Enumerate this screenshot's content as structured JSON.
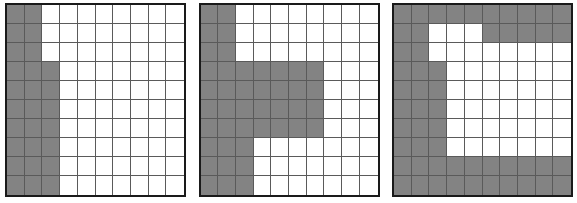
{
  "figure": {
    "title": "",
    "background_color": "#ffffff",
    "panel_count": 3,
    "grid_rows": 10,
    "grid_cols": 10,
    "shaded_color": "#838383",
    "empty_color": "#ffffff",
    "gridline_color": "#5a5a5a",
    "border_color": "#1a1a1a"
  },
  "chart_data": {
    "type": "heatmap",
    "title": "",
    "xlabel": "",
    "ylabel": "",
    "legend": [],
    "grid": true,
    "value_map": {
      "0": "empty-white-cell",
      "1": "shaded-gray-cell"
    },
    "panels": [
      {
        "name": "panel-1",
        "label": "",
        "rows": 10,
        "cols": 10,
        "matrix": [
          [
            1,
            1,
            0,
            0,
            0,
            0,
            0,
            0,
            0,
            0
          ],
          [
            1,
            1,
            0,
            0,
            0,
            0,
            0,
            0,
            0,
            0
          ],
          [
            1,
            1,
            0,
            0,
            0,
            0,
            0,
            0,
            0,
            0
          ],
          [
            1,
            1,
            1,
            0,
            0,
            0,
            0,
            0,
            0,
            0
          ],
          [
            1,
            1,
            1,
            0,
            0,
            0,
            0,
            0,
            0,
            0
          ],
          [
            1,
            1,
            1,
            0,
            0,
            0,
            0,
            0,
            0,
            0
          ],
          [
            1,
            1,
            1,
            0,
            0,
            0,
            0,
            0,
            0,
            0
          ],
          [
            1,
            1,
            1,
            0,
            0,
            0,
            0,
            0,
            0,
            0
          ],
          [
            1,
            1,
            1,
            0,
            0,
            0,
            0,
            0,
            0,
            0
          ],
          [
            1,
            1,
            1,
            0,
            0,
            0,
            0,
            0,
            0,
            0
          ]
        ]
      },
      {
        "name": "panel-2",
        "label": "",
        "rows": 10,
        "cols": 10,
        "matrix": [
          [
            1,
            1,
            0,
            0,
            0,
            0,
            0,
            0,
            0,
            0
          ],
          [
            1,
            1,
            0,
            0,
            0,
            0,
            0,
            0,
            0,
            0
          ],
          [
            1,
            1,
            0,
            0,
            0,
            0,
            0,
            0,
            0,
            0
          ],
          [
            1,
            1,
            1,
            1,
            1,
            1,
            1,
            0,
            0,
            0
          ],
          [
            1,
            1,
            1,
            1,
            1,
            1,
            1,
            0,
            0,
            0
          ],
          [
            1,
            1,
            1,
            1,
            1,
            1,
            1,
            0,
            0,
            0
          ],
          [
            1,
            1,
            1,
            1,
            1,
            1,
            1,
            0,
            0,
            0
          ],
          [
            1,
            1,
            1,
            0,
            0,
            0,
            0,
            0,
            0,
            0
          ],
          [
            1,
            1,
            1,
            0,
            0,
            0,
            0,
            0,
            0,
            0
          ],
          [
            1,
            1,
            1,
            0,
            0,
            0,
            0,
            0,
            0,
            0
          ]
        ]
      },
      {
        "name": "panel-3",
        "label": "",
        "rows": 10,
        "cols": 10,
        "matrix": [
          [
            1,
            1,
            1,
            1,
            1,
            1,
            1,
            1,
            1,
            1
          ],
          [
            1,
            1,
            0,
            0,
            0,
            1,
            1,
            1,
            1,
            1
          ],
          [
            1,
            1,
            0,
            0,
            0,
            0,
            0,
            0,
            0,
            0
          ],
          [
            1,
            1,
            1,
            0,
            0,
            0,
            0,
            0,
            0,
            0
          ],
          [
            1,
            1,
            1,
            0,
            0,
            0,
            0,
            0,
            0,
            0
          ],
          [
            1,
            1,
            1,
            0,
            0,
            0,
            0,
            0,
            0,
            0
          ],
          [
            1,
            1,
            1,
            0,
            0,
            0,
            0,
            0,
            0,
            0
          ],
          [
            1,
            1,
            1,
            0,
            0,
            0,
            0,
            0,
            0,
            0
          ],
          [
            1,
            1,
            1,
            1,
            1,
            1,
            1,
            1,
            1,
            1
          ],
          [
            1,
            1,
            1,
            1,
            1,
            1,
            1,
            1,
            1,
            1
          ]
        ]
      }
    ]
  }
}
